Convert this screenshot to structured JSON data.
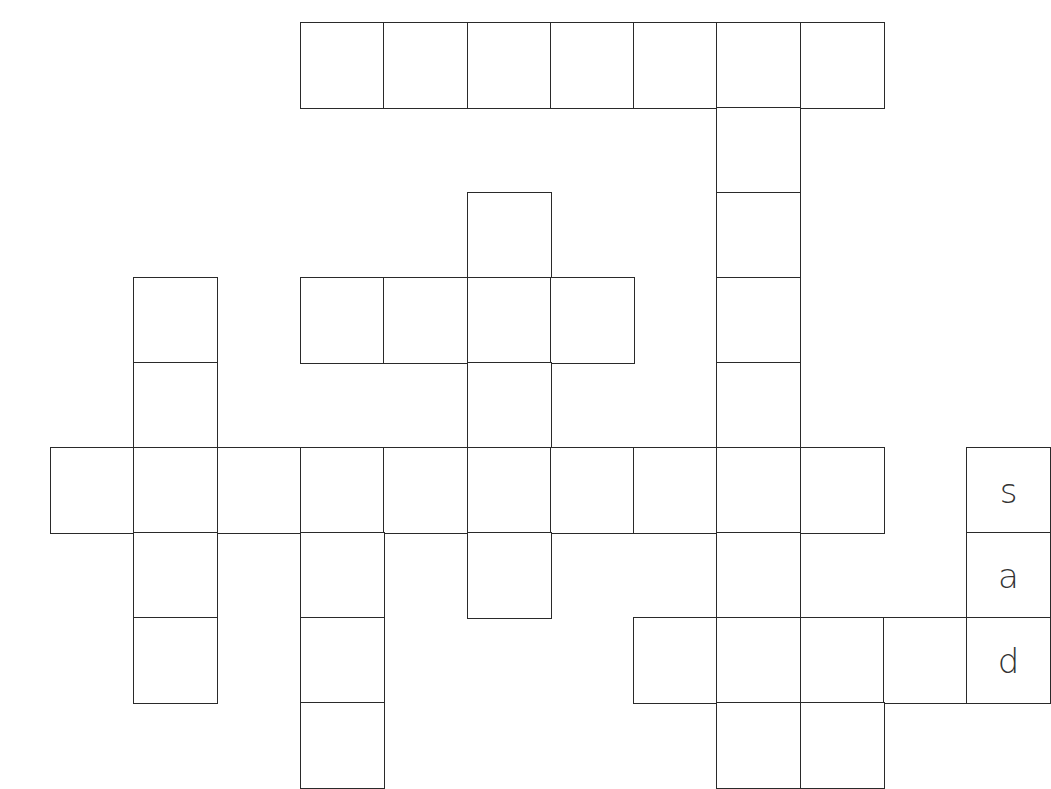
{
  "puzzle": {
    "type": "crossword",
    "cell_size": 83,
    "origin": {
      "x": 50,
      "y": 22
    },
    "line_color": "#2a2a2a",
    "letter_color": "#333333",
    "cells": [
      {
        "r": 0,
        "c": 3,
        "letter": ""
      },
      {
        "r": 0,
        "c": 4,
        "letter": ""
      },
      {
        "r": 0,
        "c": 5,
        "letter": ""
      },
      {
        "r": 0,
        "c": 6,
        "letter": ""
      },
      {
        "r": 0,
        "c": 7,
        "letter": ""
      },
      {
        "r": 0,
        "c": 8,
        "letter": ""
      },
      {
        "r": 0,
        "c": 9,
        "letter": ""
      },
      {
        "r": 1,
        "c": 8,
        "letter": ""
      },
      {
        "r": 2,
        "c": 5,
        "letter": ""
      },
      {
        "r": 2,
        "c": 8,
        "letter": ""
      },
      {
        "r": 3,
        "c": 1,
        "letter": ""
      },
      {
        "r": 3,
        "c": 3,
        "letter": ""
      },
      {
        "r": 3,
        "c": 4,
        "letter": ""
      },
      {
        "r": 3,
        "c": 5,
        "letter": ""
      },
      {
        "r": 3,
        "c": 6,
        "letter": ""
      },
      {
        "r": 3,
        "c": 8,
        "letter": ""
      },
      {
        "r": 4,
        "c": 1,
        "letter": ""
      },
      {
        "r": 4,
        "c": 5,
        "letter": ""
      },
      {
        "r": 4,
        "c": 8,
        "letter": ""
      },
      {
        "r": 5,
        "c": 0,
        "letter": ""
      },
      {
        "r": 5,
        "c": 1,
        "letter": ""
      },
      {
        "r": 5,
        "c": 2,
        "letter": ""
      },
      {
        "r": 5,
        "c": 3,
        "letter": ""
      },
      {
        "r": 5,
        "c": 4,
        "letter": ""
      },
      {
        "r": 5,
        "c": 5,
        "letter": ""
      },
      {
        "r": 5,
        "c": 6,
        "letter": ""
      },
      {
        "r": 5,
        "c": 7,
        "letter": ""
      },
      {
        "r": 5,
        "c": 8,
        "letter": ""
      },
      {
        "r": 5,
        "c": 9,
        "letter": ""
      },
      {
        "r": 5,
        "c": 11,
        "letter": "s"
      },
      {
        "r": 6,
        "c": 1,
        "letter": ""
      },
      {
        "r": 6,
        "c": 3,
        "letter": ""
      },
      {
        "r": 6,
        "c": 5,
        "letter": ""
      },
      {
        "r": 6,
        "c": 8,
        "letter": ""
      },
      {
        "r": 6,
        "c": 11,
        "letter": "a"
      },
      {
        "r": 7,
        "c": 1,
        "letter": ""
      },
      {
        "r": 7,
        "c": 3,
        "letter": ""
      },
      {
        "r": 7,
        "c": 7,
        "letter": ""
      },
      {
        "r": 7,
        "c": 8,
        "letter": ""
      },
      {
        "r": 7,
        "c": 9,
        "letter": ""
      },
      {
        "r": 7,
        "c": 10,
        "letter": ""
      },
      {
        "r": 7,
        "c": 11,
        "letter": "d"
      },
      {
        "r": 8,
        "c": 3,
        "letter": ""
      },
      {
        "r": 8,
        "c": 8,
        "letter": ""
      },
      {
        "r": 8,
        "c": 9,
        "letter": ""
      }
    ]
  }
}
